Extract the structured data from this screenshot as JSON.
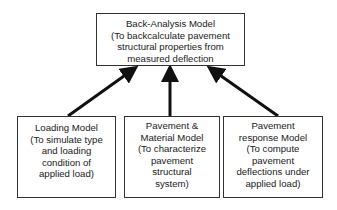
{
  "diagram": {
    "top": {
      "lines": [
        "Back-Analysis Model",
        "(To backcalculate pavement",
        "structural properties from",
        "measured deflection"
      ]
    },
    "inputs": [
      {
        "lines": [
          "Loading Model",
          "(To simulate type",
          "and loading",
          "condition of",
          "applied load)"
        ]
      },
      {
        "lines": [
          "Pavement &",
          "Material Model",
          "(To characterize",
          "pavement",
          "structural",
          "system)"
        ]
      },
      {
        "lines": [
          "Pavement",
          "response Model",
          "(To compute",
          "pavement",
          "deflections under",
          "applied load)"
        ]
      }
    ],
    "edges": [
      {
        "from": "Loading Model",
        "to": "Back-Analysis Model"
      },
      {
        "from": "Pavement & Material Model",
        "to": "Back-Analysis Model"
      },
      {
        "from": "Pavement response Model",
        "to": "Back-Analysis Model"
      }
    ],
    "colors": {
      "stroke": "#111111",
      "border": "#333333",
      "background": "#ffffff"
    }
  }
}
